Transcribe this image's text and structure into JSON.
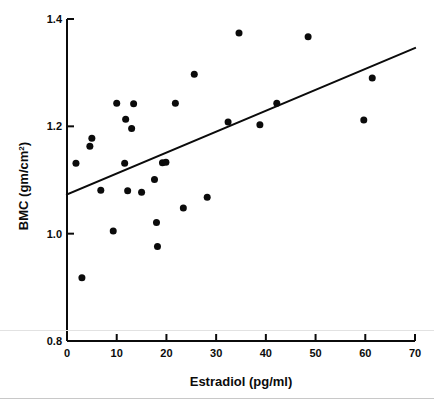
{
  "figure": {
    "background_color": "#ffffff",
    "ink_color": "#0b0b0b"
  },
  "chart_data": {
    "type": "scatter",
    "title": "",
    "xlabel": "Estradiol (pg/ml)",
    "ylabel": "BMC (gm/cm",
    "ylabel_sup": "2",
    "ylabel_tail": ")",
    "xlim": [
      0,
      70
    ],
    "ylim": [
      0.8,
      1.4
    ],
    "grid": false,
    "legend": "none",
    "xticks": [
      0,
      10,
      20,
      30,
      40,
      50,
      60,
      70
    ],
    "xtick_labels": [
      "0",
      "10",
      "20",
      "30",
      "40",
      "50",
      "60",
      "70"
    ],
    "yticks": [
      0.8,
      1.0,
      1.2,
      1.4
    ],
    "ytick_labels": [
      "0.8",
      "1.0",
      "1.2",
      "1.4"
    ],
    "marker": "filled-circle",
    "marker_color": "#0b0b0b",
    "marker_size_px": 7,
    "points": [
      {
        "x": 1.8,
        "y": 1.131
      },
      {
        "x": 3.0,
        "y": 0.918
      },
      {
        "x": 4.6,
        "y": 1.163
      },
      {
        "x": 5.0,
        "y": 1.178
      },
      {
        "x": 6.8,
        "y": 1.081
      },
      {
        "x": 9.3,
        "y": 1.005
      },
      {
        "x": 10.0,
        "y": 1.243
      },
      {
        "x": 11.6,
        "y": 1.131
      },
      {
        "x": 11.8,
        "y": 1.213
      },
      {
        "x": 12.2,
        "y": 1.08
      },
      {
        "x": 13.0,
        "y": 1.196
      },
      {
        "x": 13.4,
        "y": 1.242
      },
      {
        "x": 15.0,
        "y": 1.077
      },
      {
        "x": 17.6,
        "y": 1.101
      },
      {
        "x": 18.0,
        "y": 1.021
      },
      {
        "x": 18.2,
        "y": 0.976
      },
      {
        "x": 19.2,
        "y": 1.132
      },
      {
        "x": 19.9,
        "y": 1.133
      },
      {
        "x": 21.8,
        "y": 1.243
      },
      {
        "x": 23.4,
        "y": 1.048
      },
      {
        "x": 25.6,
        "y": 1.297
      },
      {
        "x": 28.2,
        "y": 1.068
      },
      {
        "x": 32.4,
        "y": 1.208
      },
      {
        "x": 34.6,
        "y": 1.374
      },
      {
        "x": 38.8,
        "y": 1.203
      },
      {
        "x": 42.2,
        "y": 1.243
      },
      {
        "x": 48.5,
        "y": 1.367
      },
      {
        "x": 59.7,
        "y": 1.212
      },
      {
        "x": 61.4,
        "y": 1.29
      }
    ],
    "fit_line": {
      "name": "regression-line",
      "x_start": 0,
      "y_start": 1.073,
      "x_end": 70,
      "y_end": 1.346,
      "color": "#0b0b0b",
      "width_px": 2
    }
  }
}
